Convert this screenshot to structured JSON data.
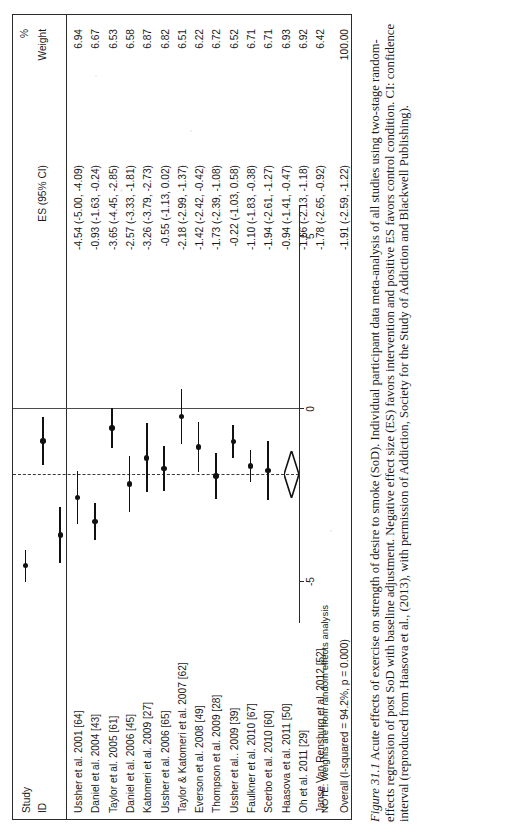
{
  "figure": {
    "label": "Figure 31.1",
    "caption": "Acute effects of exercise on strength of desire to smoke (SoD). Individual participant data meta-analysis of all studies using two-stage random-effects regression of post SoD with baseline adjustment. Negative effect size (ES) favors intervention and positive ES favors control condition. CI: confidence interval (reproduced from Haasova et al., (2013), with permission of Addiction, Society for the Study of Addiction and Blackwell Publishing)."
  },
  "header": {
    "study": "Study",
    "id": "ID",
    "es": "ES (95% CI)",
    "percent": "%",
    "weight": "Weight"
  },
  "note": "NOTE: Weights are from random effects analysis",
  "axis": {
    "ticks": [
      -5,
      0,
      5
    ],
    "tick_labels": [
      "-5",
      "0",
      "5"
    ],
    "min": -6.2,
    "max": 5.9
  },
  "chart_data": {
    "type": "forest",
    "title": "Acute effects of exercise on strength of desire to smoke (SoD)",
    "xlabel": "Effect size (ES)",
    "ylabel": "",
    "xlim": [
      -6.2,
      5.9
    ],
    "grid": false,
    "null_value": 0,
    "pooled_value": -1.91,
    "heterogeneity": "I-squared = 94.2%, p = 0.000",
    "columns": [
      "Study ID",
      "ES (95% CI)",
      "% Weight"
    ],
    "rows": [
      {
        "id": "Ussher et al. 2001 [64]",
        "es": -4.54,
        "lo": -5.0,
        "hi": -4.09,
        "weight": 6.94,
        "es_text": "-4.54 (-5.00, -4.09)",
        "weight_text": "6.94",
        "overall": false
      },
      {
        "id": "Daniel et al. 2004 [43]",
        "es": -0.93,
        "lo": -1.63,
        "hi": -0.24,
        "weight": 6.67,
        "es_text": "-0.93 (-1.63, -0.24)",
        "weight_text": "6.67",
        "overall": false
      },
      {
        "id": "Taylor et al. 2005 [61]",
        "es": -3.65,
        "lo": -4.45,
        "hi": -2.85,
        "weight": 6.53,
        "es_text": "-3.65 (-4.45, -2.85)",
        "weight_text": "6.53",
        "overall": false
      },
      {
        "id": "Daniel et al. 2006 [45]",
        "es": -2.57,
        "lo": -3.33,
        "hi": -1.81,
        "weight": 6.58,
        "es_text": "-2.57 (-3.33, -1.81)",
        "weight_text": "6.58",
        "overall": false
      },
      {
        "id": "Katomeri et al. 2009 [27]",
        "es": -3.26,
        "lo": -3.79,
        "hi": -2.73,
        "weight": 6.87,
        "es_text": "-3.26 (-3.79, -2.73)",
        "weight_text": "6.87",
        "overall": false
      },
      {
        "id": "Ussher et al. 2006 [65]",
        "es": -0.55,
        "lo": -1.13,
        "hi": 0.02,
        "weight": 6.82,
        "es_text": "-0.55 (-1.13, 0.02)",
        "weight_text": "6.82",
        "overall": false
      },
      {
        "id": "Taylor & Katomeri et al. 2007 [62]",
        "es": -2.18,
        "lo": -2.99,
        "hi": -1.37,
        "weight": 6.51,
        "es_text": "-2.18 (-2.99, -1.37)",
        "weight_text": "6.51",
        "overall": false
      },
      {
        "id": "Everson et al. 2008 [49]",
        "es": -1.42,
        "lo": -2.42,
        "hi": -0.42,
        "weight": 6.22,
        "es_text": "-1.42 (-2.42, -0.42)",
        "weight_text": "6.22",
        "overall": false
      },
      {
        "id": "Thompson et al. 2009 [28]",
        "es": -1.73,
        "lo": -2.39,
        "hi": -1.08,
        "weight": 6.72,
        "es_text": "-1.73 (-2.39, -1.08)",
        "weight_text": "6.72",
        "overall": false
      },
      {
        "id": "Ussher et al.. 2009 [39]",
        "es": -0.22,
        "lo": -1.03,
        "hi": 0.58,
        "weight": 6.52,
        "es_text": "-0.22 (-1.03, 0.58)",
        "weight_text": "6.52",
        "overall": false
      },
      {
        "id": "Faulkner et al. 2010 [67]",
        "es": -1.1,
        "lo": -1.83,
        "hi": -0.38,
        "weight": 6.71,
        "es_text": "-1.10 (-1.83, -0.38)",
        "weight_text": "6.71",
        "overall": false
      },
      {
        "id": "Scerbo et al. 2010 [60]",
        "es": -1.94,
        "lo": -2.61,
        "hi": -1.27,
        "weight": 6.71,
        "es_text": "-1.94 (-2.61, -1.27)",
        "weight_text": "6.71",
        "overall": false
      },
      {
        "id": "Haasova et al. 2011 [50]",
        "es": -0.94,
        "lo": -1.41,
        "hi": -0.47,
        "weight": 6.93,
        "es_text": "-0.94 (-1.41, -0.47)",
        "weight_text": "6.93",
        "overall": false
      },
      {
        "id": "Oh et al. 2011 [29]",
        "es": -1.66,
        "lo": -2.13,
        "hi": -1.18,
        "weight": 6.92,
        "es_text": "-1.66 (-2.13, -1.18)",
        "weight_text": "6.92",
        "overall": false
      },
      {
        "id": "Janse Van Rensburg et al. 2012 [52]",
        "es": -1.78,
        "lo": -2.65,
        "hi": -0.92,
        "weight": 6.42,
        "es_text": "-1.78 (-2.65, -0.92)",
        "weight_text": "6.42",
        "overall": false
      },
      {
        "id": "Overall (I-squared = 94.2%, p = 0.000)",
        "es": -1.91,
        "lo": -2.59,
        "hi": -1.22,
        "weight": 100.0,
        "es_text": "-1.91 (-2.59, -1.22)",
        "weight_text": "100.00",
        "overall": true
      }
    ]
  }
}
